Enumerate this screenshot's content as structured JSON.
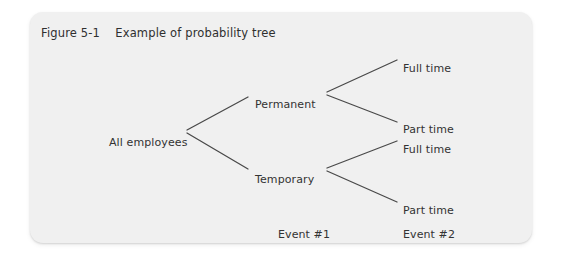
{
  "figure": {
    "title": "Figure 5-1    Example of probability tree",
    "title_number": "Figure 5-1",
    "title_text": "Example of probability tree",
    "card_color": "#f0f0f0",
    "line_color": "#4a4a4a",
    "text_color": "#333333"
  },
  "tree": {
    "root": {
      "label": "All employees"
    },
    "level1": [
      {
        "label": "Permanent"
      },
      {
        "label": "Temporary"
      }
    ],
    "leaves": [
      {
        "label": "Full time",
        "parent": "Permanent"
      },
      {
        "label": "Part time",
        "parent": "Permanent"
      },
      {
        "label": "Full time",
        "parent": "Temporary"
      },
      {
        "label": "Part time",
        "parent": "Temporary"
      }
    ]
  },
  "events": [
    {
      "label": "Event #1"
    },
    {
      "label": "Event #2"
    }
  ]
}
